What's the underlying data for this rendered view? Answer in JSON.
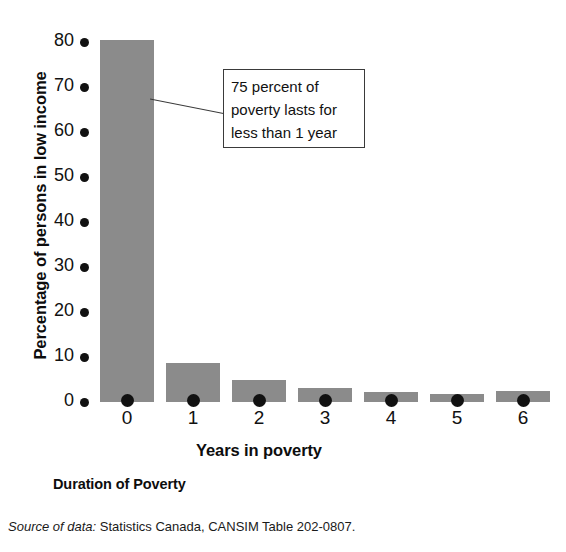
{
  "chart_data": {
    "type": "bar",
    "title": "Duration of Poverty",
    "xlabel": "Years in poverty",
    "ylabel": "Percentage of persons in low income",
    "categories": [
      "0",
      "1",
      "2",
      "3",
      "4",
      "5",
      "6"
    ],
    "values": [
      80.5,
      8.7,
      5.0,
      3.2,
      2.3,
      1.7,
      2.5
    ],
    "ylim": [
      0,
      85
    ],
    "yticks": [
      0,
      10,
      20,
      30,
      40,
      50,
      60,
      70,
      80
    ],
    "ytick_labels": [
      "0",
      "10",
      "20",
      "30",
      "40",
      "50",
      "60",
      "70",
      "80"
    ],
    "grid": false,
    "legend": "none",
    "bar_color": "#8b8b8b",
    "axis_marker_color": "#111111",
    "annotations": [
      {
        "lines": [
          "75 percent of",
          "poverty lasts for",
          "less than 1 year"
        ],
        "target_category": "0",
        "style": "boxed-callout"
      }
    ]
  },
  "figure": {
    "caption": "Duration of Poverty",
    "source_label": "Source of data:",
    "source_text": "Statistics Canada, CANSIM Table 202-0807."
  }
}
